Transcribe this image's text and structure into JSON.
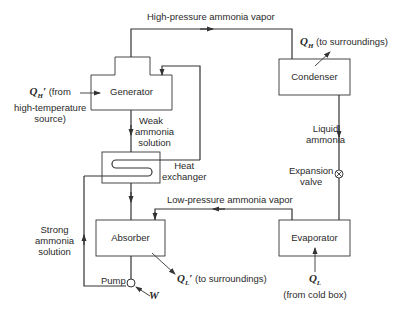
{
  "diagram": {
    "components": {
      "generator": "Generator",
      "condenser": "Condenser",
      "evaporator": "Evaporator",
      "absorber": "Absorber",
      "heat_exchanger": "Heat exchanger",
      "heat_exchanger_line1": "Heat",
      "heat_exchanger_line2": "exchanger",
      "expansion_valve_line1": "Expansion",
      "expansion_valve_line2": "valve",
      "pump": "Pump"
    },
    "flows": {
      "high_pressure_vapor": "High-pressure ammonia vapor",
      "low_pressure_vapor": "Low-pressure ammonia vapor",
      "weak_solution_line1": "Weak",
      "weak_solution_line2": "ammonia",
      "weak_solution_line3": "solution",
      "strong_solution_line1": "Strong",
      "strong_solution_line2": "ammonia",
      "strong_solution_line3": "solution",
      "liquid_ammonia_line1": "Liquid",
      "liquid_ammonia_line2": "ammonia"
    },
    "heat_transfers": {
      "qh_prime_symbol": "Q",
      "qh_prime_sub": "H",
      "qh_prime_mark": "′",
      "qh_prime_text1": " (from",
      "qh_prime_text2": "high-temperature",
      "qh_prime_text3": "source)",
      "qh_symbol": "Q",
      "qh_sub": "H",
      "qh_text": "(to surroundings)",
      "ql_prime_symbol": "Q",
      "ql_prime_sub": "L",
      "ql_prime_mark": "′",
      "ql_prime_text": "(to surroundings)",
      "ql_symbol": "Q",
      "ql_sub": "L",
      "ql_text": "(from cold box)",
      "work_symbol": "W"
    },
    "colors": {
      "line": "#333333",
      "background": "#ffffff",
      "text": "#2a2a2a"
    }
  }
}
